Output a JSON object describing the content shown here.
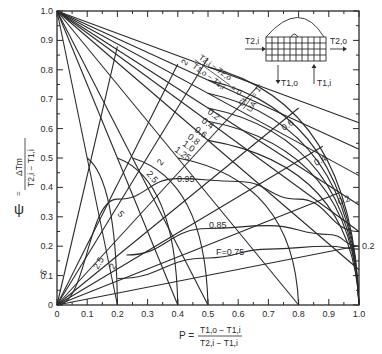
{
  "chart_data": {
    "type": "line",
    "title": "",
    "xlabel": "P = (T1,o − T1,i) / (T2,i − T1,i)",
    "ylabel": "ψ = ΔTm / (T2,i − T1,i)",
    "xlim": [
      0,
      1.0
    ],
    "ylim": [
      0,
      1.0
    ],
    "grid": false,
    "x_ticks": [
      "0",
      "0.1",
      "0.2",
      "0.3",
      "0.4",
      "0.5",
      "0.6",
      "0.7",
      "0.8",
      "0.9",
      "1.0"
    ],
    "y_ticks": [
      "0",
      "0.1",
      "0.2",
      "0.3",
      "0.4",
      "0.5",
      "0.6",
      "0.7",
      "0.8",
      "0.9",
      "1.0"
    ],
    "R_lines": {
      "label": "(T2,i − T2,o)/(T1,o − T1,i)",
      "description": "Straight lines from (P=0, ψ=1.0)",
      "series": [
        {
          "name": "0",
          "end": [
            1.0,
            0.62
          ]
        },
        {
          "name": "0.2",
          "end": [
            1.0,
            0.53
          ]
        },
        {
          "name": "0.4",
          "end": [
            1.0,
            0.44
          ]
        },
        {
          "name": "0.6",
          "end": [
            1.0,
            0.34
          ]
        },
        {
          "name": "0.8",
          "end": [
            1.0,
            0.25
          ]
        },
        {
          "name": "1.0",
          "end": [
            1.0,
            0.12
          ]
        },
        {
          "name": "1.25",
          "end": [
            0.8,
            0.0
          ]
        },
        {
          "name": "2",
          "end": [
            0.5,
            0.0
          ]
        },
        {
          "name": "2.5",
          "end": [
            0.4,
            0.0
          ]
        },
        {
          "name": "5",
          "end": [
            0.2,
            0.0
          ]
        }
      ]
    },
    "Ct_UA_lines": {
      "label": "Ct/UA",
      "description": "Straight lines from origin",
      "series": [
        {
          "name": "5",
          "end": [
            0.2,
            0.88
          ]
        },
        {
          "name": "2.5",
          "end": [
            0.4,
            0.82
          ]
        },
        {
          "name": "2",
          "end": [
            0.5,
            0.84
          ]
        },
        {
          "name": "1",
          "end": [
            0.67,
            0.75
          ]
        },
        {
          "name": "0.8",
          "end": [
            0.8,
            0.67
          ]
        },
        {
          "name": "0.6",
          "end": [
            0.88,
            0.54
          ]
        },
        {
          "name": "0.4",
          "end": [
            0.93,
            0.38
          ]
        },
        {
          "name": "0.2",
          "end": [
            0.99,
            0.2
          ]
        }
      ]
    },
    "F_curves": {
      "label": "F",
      "series": [
        {
          "name": "0.95",
          "points": [
            [
              0.0,
              0.0
            ],
            [
              0.2,
              0.36
            ],
            [
              0.4,
              0.43
            ],
            [
              0.6,
              0.42
            ],
            [
              0.8,
              0.36
            ],
            [
              1.0,
              0.25
            ]
          ]
        },
        {
          "name": "0.85",
          "points": [
            [
              0.23,
              0.17
            ],
            [
              0.5,
              0.26
            ],
            [
              0.7,
              0.27
            ],
            [
              0.9,
              0.24
            ],
            [
              1.0,
              0.2
            ]
          ]
        },
        {
          "name": "F=0.75",
          "points": [
            [
              0.2,
              0.09
            ],
            [
              0.5,
              0.16
            ],
            [
              0.7,
              0.19
            ],
            [
              0.9,
              0.2
            ],
            [
              1.0,
              0.19
            ]
          ]
        }
      ]
    },
    "R_curves": {
      "description": "Curved R lines ending on ψ=0 / P axis",
      "series": [
        {
          "name": "0",
          "end_P": 1.0
        },
        {
          "name": "0.2",
          "end_P": 1.0
        },
        {
          "name": "0.4",
          "end_P": 1.0
        },
        {
          "name": "0.6",
          "end_P": 1.0
        },
        {
          "name": "0.8",
          "end_P": 1.0
        },
        {
          "name": "1.0",
          "end_P": 1.0
        },
        {
          "name": "1.25",
          "end_P": 0.8
        },
        {
          "name": "2",
          "end_P": 0.5
        },
        {
          "name": "2.5",
          "end_P": 0.4
        },
        {
          "name": "5",
          "end_P": 0.2
        }
      ]
    },
    "inset": {
      "inlet_hot": "T2,i",
      "outlet_hot": "T2,o",
      "outlet_cold": "T1,o",
      "inlet_cold": "T1,i"
    },
    "labels": {
      "r_eq_lhs_num": "T2,i − T2,o",
      "r_eq_lhs_den": "T1,o − T1,i",
      "r_eq_rhs": "= 0",
      "ct_num": "Ct",
      "ct_den": "UA",
      "ct_rhs": "= 1",
      "psi_label": "ψ =",
      "psi_num": "ΔTm",
      "psi_den": "T2,i − T1,i",
      "p_label": "P =",
      "p_num": "T1,o − T1,i",
      "p_den": "T2,i − T1,i"
    }
  }
}
